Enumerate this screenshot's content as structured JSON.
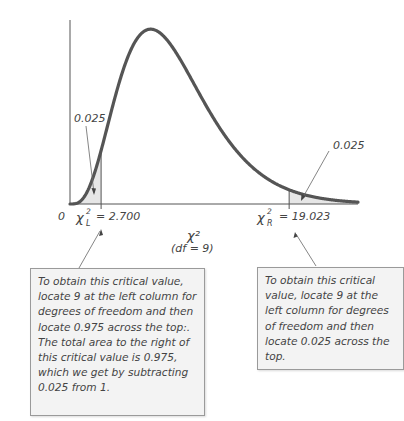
{
  "chart_data": {
    "type": "area",
    "title": "",
    "distribution": "chi-square",
    "df": 9,
    "xlabel": "χ²",
    "xlabel_sub": "(df = 9)",
    "origin_label": "0",
    "xlim": [
      0,
      25
    ],
    "ylim": [
      0,
      0.106
    ],
    "grid": false,
    "critical_values": [
      {
        "name": "left",
        "symbol": "χ",
        "subscript": "L",
        "value": 2.7,
        "label": "= 2.700",
        "tail_area": 0.025,
        "tail_label": "0.025"
      },
      {
        "name": "right",
        "symbol": "χ",
        "subscript": "R",
        "value": 19.023,
        "label": "= 19.023",
        "tail_area": 0.025,
        "tail_label": "0.025"
      }
    ],
    "colors": {
      "curve": "#555555",
      "shade": "#e6e6e6",
      "axis": "#555555"
    }
  },
  "notes": {
    "left": "To obtain this critical value, locate 9 at the left column for degrees of freedom and then locate 0.975 across the top:. The total area to the right of this critical value is 0.975, which we get by subtracting 0.025 from 1.",
    "right": "To obtain this critical value, locate 9 at the left column for degrees of freedom and then locate 0.025 across the top."
  }
}
